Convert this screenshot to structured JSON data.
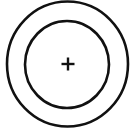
{
  "icon": {
    "name": "concentric-circles-with-plus",
    "stroke_color": "#111111",
    "background": "#ffffff",
    "outer_circle": {
      "cx": 67.5,
      "cy": 64,
      "rx": 60.5,
      "ry": 62.5,
      "stroke_width": 2.6
    },
    "inner_circle": {
      "cx": 67,
      "cy": 64.5,
      "rx": 42,
      "ry": 43.5,
      "stroke_width": 2.6
    },
    "plus": {
      "cx": 68,
      "cy": 64,
      "half_length": 6.5,
      "stroke_width": 2.4
    }
  }
}
